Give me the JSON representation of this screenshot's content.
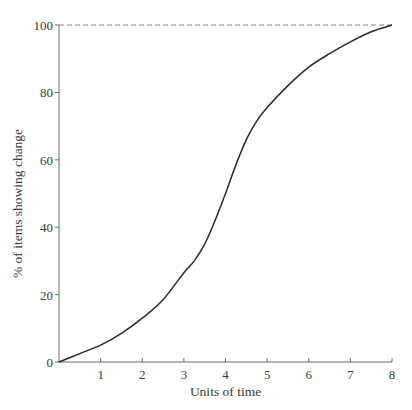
{
  "chart_data": {
    "type": "line",
    "title": "",
    "xlabel": "Units of time",
    "ylabel": "% of items showing change",
    "xlim": [
      0,
      8
    ],
    "ylim": [
      0,
      100
    ],
    "grid": false,
    "legend": null,
    "x_ticks": [
      1,
      2,
      3,
      4,
      5,
      6,
      7,
      8
    ],
    "y_ticks": [
      0,
      20,
      40,
      60,
      80,
      100
    ],
    "reference_line": {
      "y": 100,
      "style": "dashed"
    },
    "series": [
      {
        "name": "S-curve",
        "x": [
          0,
          0.5,
          1,
          1.5,
          2,
          2.5,
          3,
          3.25,
          3.5,
          3.75,
          4,
          4.25,
          4.5,
          4.75,
          5,
          5.5,
          6,
          6.5,
          7,
          7.5,
          8
        ],
        "y": [
          0,
          2.5,
          5,
          8.5,
          13,
          18.5,
          26.5,
          30,
          35,
          42,
          50,
          58.5,
          66,
          71.5,
          75.5,
          82,
          87.5,
          91.5,
          95,
          98,
          100
        ]
      }
    ]
  },
  "labels": {
    "x_title": "Units of time",
    "y_title": "% of items showing change"
  },
  "colors": {
    "curve": "#2a2a2a",
    "axis": "#6a6a6a",
    "text": "#3a3a3a",
    "reference": "#888888"
  }
}
